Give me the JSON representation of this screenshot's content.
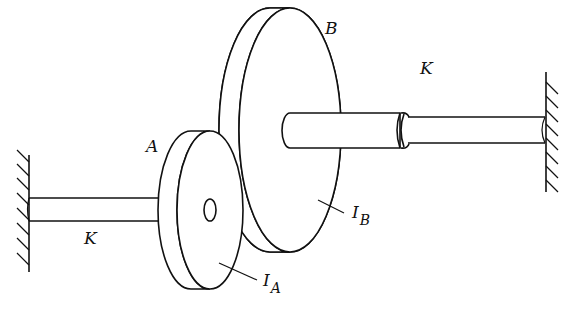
{
  "diagram": {
    "type": "mechanical-schematic",
    "labels": {
      "disk_a": "A",
      "disk_b": "B",
      "shaft_left_stiffness": "K",
      "shaft_right_stiffness": "K",
      "inertia_a": {
        "main": "I",
        "sub": "A"
      },
      "inertia_b": {
        "main": "I",
        "sub": "B"
      }
    },
    "colors": {
      "stroke": "#111111",
      "background": "#ffffff"
    }
  }
}
